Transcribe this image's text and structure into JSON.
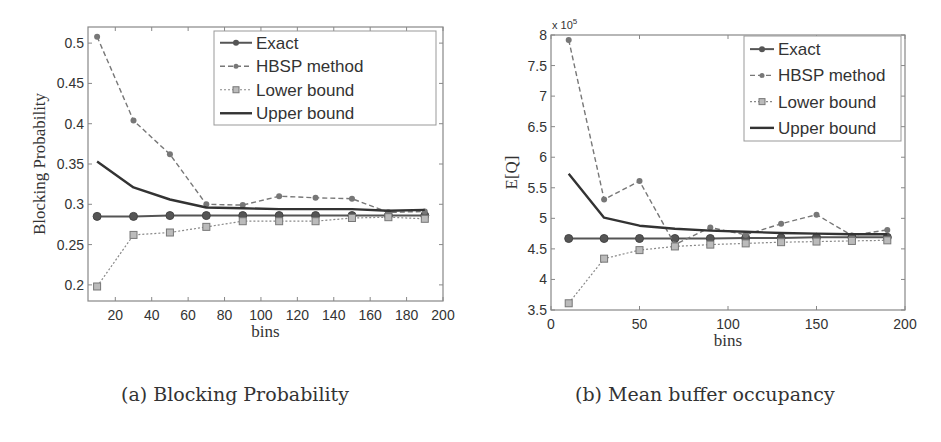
{
  "chart_data": [
    {
      "type": "line",
      "title": "",
      "caption": "(a) Blocking Probability",
      "xlabel": "bins",
      "ylabel": "Blocking Probability",
      "xlim": [
        5,
        200
      ],
      "ylim": [
        0.18,
        0.52
      ],
      "xticks": [
        20,
        40,
        60,
        80,
        100,
        120,
        140,
        160,
        180,
        200
      ],
      "yticks": [
        0.2,
        0.25,
        0.3,
        0.35,
        0.4,
        0.45,
        0.5
      ],
      "ytick_labels": [
        "0.2",
        "0.25",
        "0.3",
        "0.35",
        "0.4",
        "0.45",
        "0.5"
      ],
      "grid": false,
      "legend_position": "upper right",
      "x": [
        10,
        30,
        50,
        70,
        90,
        110,
        130,
        150,
        170,
        190
      ],
      "series": [
        {
          "name": "Exact",
          "style": "solid-circle",
          "values": [
            0.285,
            0.285,
            0.286,
            0.286,
            0.286,
            0.286,
            0.286,
            0.286,
            0.286,
            0.286
          ]
        },
        {
          "name": "HBSP method",
          "style": "dashed-circle",
          "values": [
            0.508,
            0.404,
            0.362,
            0.3,
            0.299,
            0.31,
            0.308,
            0.307,
            0.29,
            0.291
          ]
        },
        {
          "name": "Lower bound",
          "style": "dotted-square",
          "values": [
            0.198,
            0.262,
            0.265,
            0.272,
            0.279,
            0.279,
            0.279,
            0.283,
            0.284,
            0.282
          ]
        },
        {
          "name": "Upper bound",
          "style": "solid-thick",
          "values": [
            0.353,
            0.321,
            0.306,
            0.296,
            0.295,
            0.294,
            0.294,
            0.294,
            0.292,
            0.293
          ]
        }
      ]
    },
    {
      "type": "line",
      "title": "",
      "caption": "(b) Mean buffer occupancy",
      "xlabel": "bins",
      "ylabel": "E[Q]",
      "multiplier_label": "x 10",
      "multiplier_exp": "5",
      "xlim": [
        0,
        200
      ],
      "ylim": [
        3.5,
        8
      ],
      "xticks": [
        0,
        50,
        100,
        150,
        200
      ],
      "yticks": [
        3.5,
        4,
        4.5,
        5,
        5.5,
        6,
        6.5,
        7,
        7.5,
        8
      ],
      "ytick_labels": [
        "3.5",
        "4",
        "4.5",
        "5",
        "5.5",
        "6",
        "6.5",
        "7",
        "7.5",
        "8"
      ],
      "grid": false,
      "legend_position": "upper right",
      "x": [
        10,
        30,
        50,
        70,
        90,
        110,
        130,
        150,
        170,
        190
      ],
      "series": [
        {
          "name": "Exact",
          "style": "solid-circle",
          "values": [
            4.67,
            4.67,
            4.67,
            4.67,
            4.67,
            4.68,
            4.68,
            4.69,
            4.69,
            4.69
          ]
        },
        {
          "name": "HBSP method",
          "style": "dashed-circle",
          "values": [
            7.92,
            5.31,
            5.61,
            4.57,
            4.85,
            4.73,
            4.91,
            5.06,
            4.72,
            4.81
          ]
        },
        {
          "name": "Lower bound",
          "style": "dotted-square",
          "values": [
            3.61,
            4.34,
            4.48,
            4.54,
            4.57,
            4.59,
            4.61,
            4.62,
            4.63,
            4.64
          ]
        },
        {
          "name": "Upper bound",
          "style": "solid-thick",
          "values": [
            5.73,
            5.01,
            4.88,
            4.83,
            4.8,
            4.78,
            4.76,
            4.75,
            4.74,
            4.74
          ]
        }
      ]
    }
  ]
}
